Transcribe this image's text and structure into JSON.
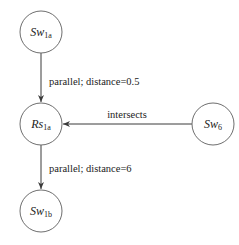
{
  "diagram": {
    "nodes": [
      {
        "id": "sw1a",
        "base": "Sw",
        "sub": "1a"
      },
      {
        "id": "rs1a",
        "base": "Rs",
        "sub": "1a"
      },
      {
        "id": "sw6",
        "base": "Sw",
        "sub": "6"
      },
      {
        "id": "sw1b",
        "base": "Sw",
        "sub": "1b"
      }
    ],
    "edges": [
      {
        "from": "sw1a",
        "to": "rs1a",
        "label": "parallel; distance=0.5"
      },
      {
        "from": "sw6",
        "to": "rs1a",
        "label": "intersects"
      },
      {
        "from": "rs1a",
        "to": "sw1b",
        "label": "parallel;  distance=6"
      }
    ]
  }
}
